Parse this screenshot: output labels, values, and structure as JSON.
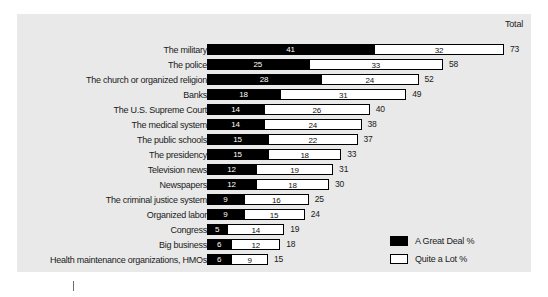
{
  "chart_data": {
    "type": "bar",
    "orientation": "horizontal",
    "stacked": true,
    "title": "",
    "xlabel": "",
    "ylabel": "",
    "total_header": "Total",
    "xlim": [
      0,
      73
    ],
    "grid": false,
    "legend_position": "bottom-right",
    "series": [
      {
        "name": "A Great Deal %",
        "color": "#000000",
        "values": [
          41,
          25,
          28,
          18,
          14,
          14,
          15,
          15,
          12,
          12,
          9,
          9,
          5,
          6,
          6
        ]
      },
      {
        "name": "Quite a Lot %",
        "color": "#ffffff",
        "values": [
          32,
          33,
          24,
          31,
          26,
          24,
          22,
          18,
          19,
          18,
          16,
          15,
          14,
          12,
          9
        ]
      }
    ],
    "categories": [
      "The military",
      "The police",
      "The church or organized religion",
      "Banks",
      "The U.S. Supreme Court",
      "The medical system",
      "The public schools",
      "The presidency",
      "Television news",
      "Newspapers",
      "The criminal justice system",
      "Organized labor",
      "Congress",
      "Big business",
      "Health maintenance organizations, HMOs"
    ],
    "totals": [
      73,
      58,
      52,
      49,
      40,
      38,
      37,
      33,
      31,
      30,
      25,
      24,
      19,
      18,
      15
    ]
  },
  "legend": {
    "items": [
      {
        "label": "A Great Deal %",
        "swatch": "great"
      },
      {
        "label": "Quite a Lot %",
        "swatch": "quite"
      }
    ]
  }
}
